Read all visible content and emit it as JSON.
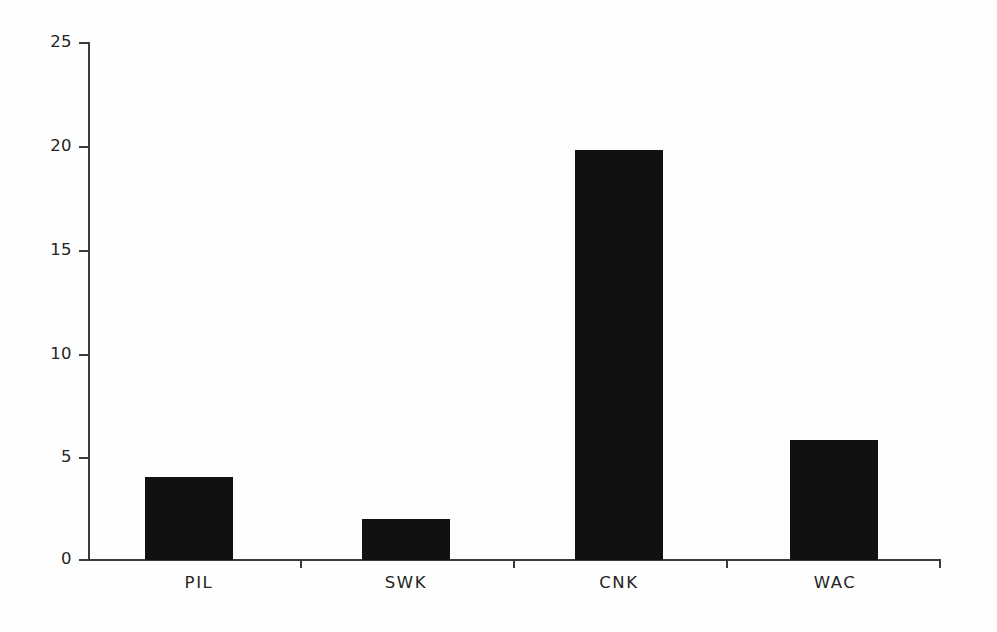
{
  "chart_data": {
    "type": "bar",
    "title": "",
    "subtitle": "",
    "xlabel": "",
    "ylabel": "",
    "categories": [
      "PIL",
      "SWK",
      "CNK",
      "WAC"
    ],
    "values": [
      4.0,
      2.0,
      19.8,
      5.8
    ],
    "series": [
      {
        "name": "",
        "values": [
          4.0,
          2.0,
          19.8,
          5.8
        ]
      }
    ],
    "ylim": [
      0,
      25
    ],
    "yticks": [
      0,
      5,
      10,
      15,
      20,
      25
    ],
    "ytick_labels": [
      "0",
      "5",
      "10",
      "15",
      "20",
      "25"
    ],
    "xtick_labels": [
      "PIL",
      "SWK",
      "CNK",
      "WAC"
    ],
    "grid": false,
    "legend": null,
    "legend_position": "none",
    "annotations": [],
    "bar_color": "#111111",
    "axis_color": "#3a3a3a",
    "background_color": "#fefefe"
  }
}
